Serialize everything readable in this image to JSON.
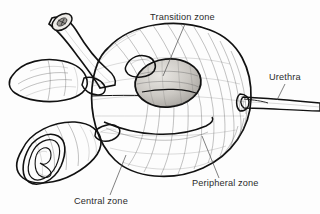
{
  "figure": {
    "background_color": "#fdfdfd",
    "ink_color": "#111111",
    "label_color": "#2b2b2b",
    "leader_color": "#4a4a4a",
    "width": 320,
    "height": 214,
    "style": "pen-and-ink medical line drawing with hatched shading"
  },
  "labels": [
    {
      "id": "transition-zone",
      "text": "Transition zone",
      "text_x": 150,
      "text_y": 20,
      "anchor": "start",
      "leader_from_x": 185,
      "leader_from_y": 24,
      "leader_to_x": 163,
      "leader_to_y": 76
    },
    {
      "id": "urethra",
      "text": "Urethra",
      "text_x": 269,
      "text_y": 80,
      "anchor": "start",
      "leader_from_x": 285,
      "leader_from_y": 84,
      "leader_to_x": 277,
      "leader_to_y": 100
    },
    {
      "id": "peripheral-zone",
      "text": "Peripheral zone",
      "text_x": 192,
      "text_y": 186,
      "anchor": "start",
      "leader_from_x": 219,
      "leader_from_y": 178,
      "leader_to_x": 202,
      "leader_to_y": 136
    },
    {
      "id": "central-zone",
      "text": "Central zone",
      "text_x": 74,
      "text_y": 204,
      "anchor": "start",
      "leader_from_x": 110,
      "leader_from_y": 195,
      "leader_to_x": 126,
      "leader_to_y": 155
    }
  ],
  "structures": [
    {
      "id": "prostate-body",
      "name": "prostate gland body",
      "description": "large ovoid gland occupying the center and right of the figure, rendered with curved hatching"
    },
    {
      "id": "transition-zone-oval",
      "name": "transition zone",
      "description": "oval lobe outlined near the center of the prostate surrounding the urethra"
    },
    {
      "id": "urethra-tube",
      "name": "urethra",
      "description": "tapering tube exiting the prostate apex toward the right edge"
    },
    {
      "id": "vas-deferens",
      "name": "vas deferens",
      "description": "tubular duct with cut circular end at upper left curving down into the gland base"
    },
    {
      "id": "seminal-vesicle-upper",
      "name": "seminal vesicle (intact)",
      "description": "lobulated sac at mid left of the figure"
    },
    {
      "id": "seminal-vesicle-lower",
      "name": "seminal vesicle (cut open)",
      "description": "sac at lower left opened to show internal convoluted mucosal folds"
    }
  ]
}
